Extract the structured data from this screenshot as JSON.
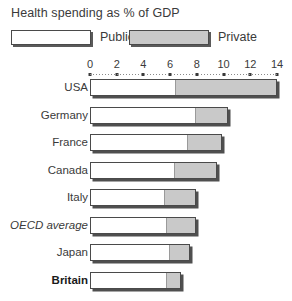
{
  "title": "Health spending as % of GDP",
  "legend": {
    "public": {
      "label": "Public",
      "color": "#ffffff",
      "icon": "legend-swatch-public"
    },
    "private": {
      "label": "Private",
      "color": "#c9c9c9",
      "icon": "legend-swatch-private"
    }
  },
  "axis": {
    "ticks": [
      "0",
      "2",
      "4",
      "6",
      "8",
      "10",
      "12",
      "14"
    ],
    "min": 0,
    "max": 14
  },
  "chart_data": {
    "type": "bar",
    "title": "Health spending as % of GDP",
    "xlabel": "% of GDP",
    "ylabel": "",
    "orientation": "horizontal",
    "stacked": true,
    "grid": false,
    "legend_position": "top",
    "xlim": [
      0,
      14
    ],
    "xticks": [
      0,
      2,
      4,
      6,
      8,
      10,
      12,
      14
    ],
    "categories": [
      "USA",
      "Germany",
      "France",
      "Canada",
      "Italy",
      "OECD average",
      "Japan",
      "Britain"
    ],
    "series": [
      {
        "name": "Public",
        "color": "#ffffff",
        "values": [
          6.4,
          7.9,
          7.3,
          6.4,
          5.6,
          5.8,
          6.0,
          5.8
        ]
      },
      {
        "name": "Private",
        "color": "#c9c9c9",
        "values": [
          7.6,
          2.4,
          2.6,
          3.1,
          2.3,
          2.1,
          1.5,
          1.0
        ]
      }
    ],
    "totals": [
      14.0,
      10.3,
      9.9,
      9.5,
      7.9,
      7.9,
      7.5,
      6.8
    ]
  },
  "rows": [
    {
      "label": "USA",
      "style": "normal",
      "public": 6.4,
      "private": 7.6,
      "total": 14.0
    },
    {
      "label": "Germany",
      "style": "normal",
      "public": 7.9,
      "private": 2.4,
      "total": 10.3
    },
    {
      "label": "France",
      "style": "normal",
      "public": 7.3,
      "private": 2.6,
      "total": 9.9
    },
    {
      "label": "Canada",
      "style": "normal",
      "public": 6.4,
      "private": 3.1,
      "total": 9.5
    },
    {
      "label": "Italy",
      "style": "normal",
      "public": 5.6,
      "private": 2.3,
      "total": 7.9
    },
    {
      "label": "OECD average",
      "style": "italic",
      "public": 5.8,
      "private": 2.1,
      "total": 7.9
    },
    {
      "label": "Japan",
      "style": "normal",
      "public": 6.0,
      "private": 1.5,
      "total": 7.5
    },
    {
      "label": "Britain",
      "style": "bold",
      "public": 5.8,
      "private": 1.0,
      "total": 6.8
    }
  ]
}
